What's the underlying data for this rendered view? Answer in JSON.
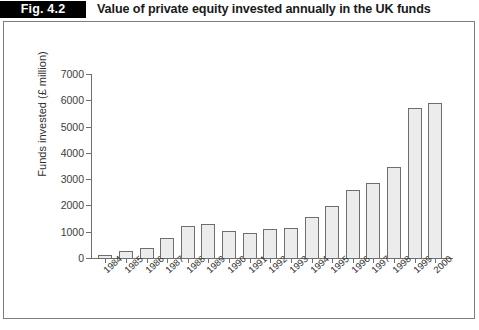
{
  "header": {
    "figure_badge": "Fig. 4.2",
    "title": "Value of private equity invested annually in the UK funds"
  },
  "chart_data": {
    "type": "bar",
    "title": "Value of private equity invested annually in the UK funds",
    "xlabel": "",
    "ylabel": "Funds invested (£ million)",
    "ylim": [
      0,
      7000
    ],
    "yticks": [
      0,
      1000,
      2000,
      3000,
      4000,
      5000,
      6000,
      7000
    ],
    "ytick_labels": [
      "0",
      "1000",
      "2000",
      "3000",
      "4000",
      "5000",
      "6000",
      "7000"
    ],
    "grid": false,
    "legend": false,
    "bar_fill": "#ececec",
    "bar_stroke": "#6e6e6e",
    "categories": [
      "1984",
      "1985",
      "1986",
      "1987",
      "1988",
      "1989",
      "1990",
      "1991",
      "1992",
      "1993",
      "1994",
      "1995",
      "1996",
      "1997",
      "1998",
      "1999",
      "2000"
    ],
    "values": [
      110,
      250,
      380,
      750,
      1230,
      1290,
      1040,
      940,
      1100,
      1150,
      1550,
      1970,
      2600,
      2840,
      3450,
      5700,
      5900
    ]
  }
}
